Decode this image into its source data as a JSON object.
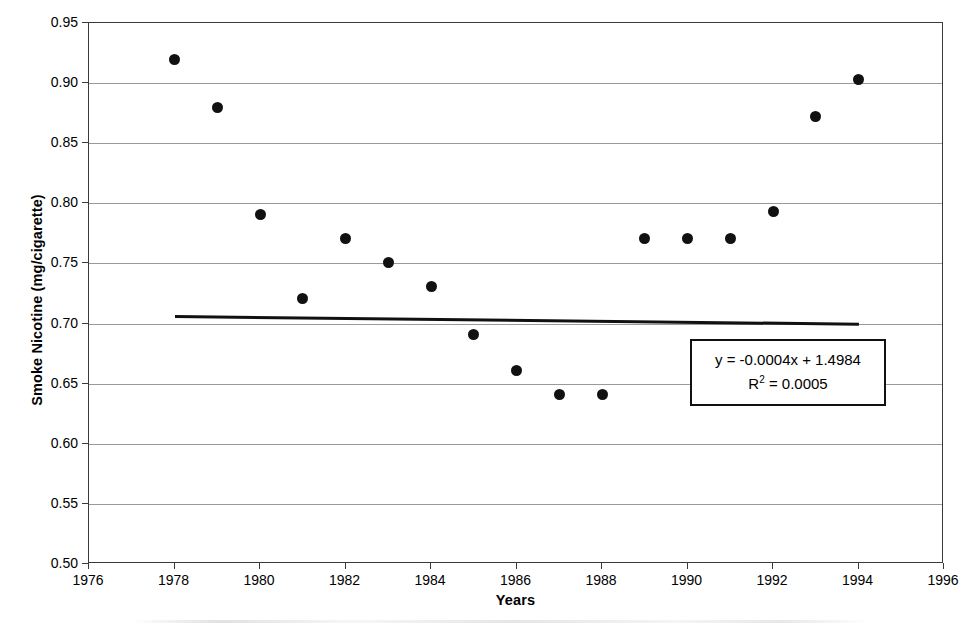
{
  "chart_data": {
    "type": "scatter",
    "title": "",
    "xlabel": "Years",
    "ylabel": "Smoke Nicotine (mg/cigarette)",
    "xlim": [
      1976,
      1996
    ],
    "ylim": [
      0.5,
      0.95
    ],
    "xticks": [
      1976,
      1978,
      1980,
      1982,
      1984,
      1986,
      1988,
      1990,
      1992,
      1994,
      1996
    ],
    "xtick_labels": [
      "1976",
      "1978",
      "1980",
      "1982",
      "1984",
      "1986",
      "1988",
      "1990",
      "1992",
      "1994",
      "1996"
    ],
    "yticks": [
      0.5,
      0.55,
      0.6,
      0.65,
      0.7,
      0.75,
      0.8,
      0.85,
      0.9,
      0.95
    ],
    "ytick_labels": [
      "0.50",
      "0.55",
      "0.60",
      "0.65",
      "0.70",
      "0.75",
      "0.80",
      "0.85",
      "0.90",
      "0.95"
    ],
    "grid": "horizontal",
    "legend": "none",
    "x": [
      1978,
      1979,
      1980,
      1981,
      1982,
      1983,
      1984,
      1985,
      1986,
      1987,
      1988,
      1989,
      1990,
      1991,
      1992,
      1993,
      1994
    ],
    "values": [
      0.92,
      0.88,
      0.791,
      0.721,
      0.771,
      0.751,
      0.731,
      0.691,
      0.661,
      0.641,
      0.641,
      0.771,
      0.771,
      0.771,
      0.793,
      0.872,
      0.903
    ],
    "series": [
      {
        "name": "Smoke Nicotine",
        "marker": "filled-circle",
        "color": "#111111",
        "points": [
          {
            "x": 1978,
            "y": 0.92
          },
          {
            "x": 1979,
            "y": 0.88
          },
          {
            "x": 1980,
            "y": 0.791
          },
          {
            "x": 1981,
            "y": 0.721
          },
          {
            "x": 1982,
            "y": 0.771
          },
          {
            "x": 1983,
            "y": 0.751
          },
          {
            "x": 1984,
            "y": 0.731
          },
          {
            "x": 1985,
            "y": 0.691
          },
          {
            "x": 1986,
            "y": 0.661
          },
          {
            "x": 1987,
            "y": 0.641
          },
          {
            "x": 1988,
            "y": 0.641
          },
          {
            "x": 1989,
            "y": 0.771
          },
          {
            "x": 1990,
            "y": 0.771
          },
          {
            "x": 1991,
            "y": 0.771
          },
          {
            "x": 1992,
            "y": 0.793
          },
          {
            "x": 1993,
            "y": 0.872
          },
          {
            "x": 1994,
            "y": 0.903
          }
        ]
      }
    ],
    "trendline": {
      "type": "linear",
      "slope": -0.0004,
      "intercept": 1.4984,
      "x_start": 1978,
      "x_end": 1994,
      "y_start": 0.7072,
      "y_end": 0.7008,
      "color": "#111111"
    },
    "annotations": {
      "equation": "y = -0.0004x + 1.4984",
      "r_squared_label": "R",
      "r_squared_exponent": "2",
      "r_squared_value": "= 0.0005"
    }
  },
  "colors": {
    "marker": "#111111",
    "trendline": "#111111",
    "gridline": "#9a9a9a",
    "axis": "#3a3a3a",
    "background": "#ffffff"
  }
}
